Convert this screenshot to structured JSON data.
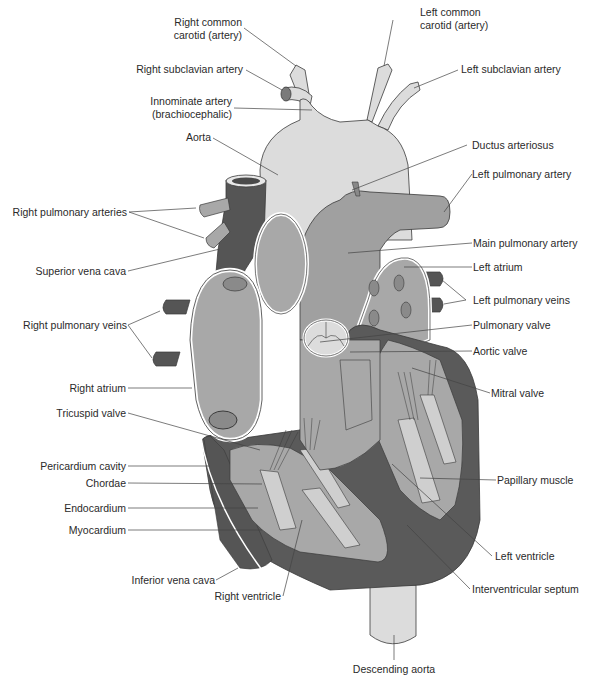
{
  "diagram": {
    "colors": {
      "aorta_light": "#dcdcdc",
      "chamber_mid": "#a8a8a8",
      "pulmonary_mid": "#9e9e9e",
      "vessel_dark": "#555555",
      "myocardium_dark": "#5a5a5a",
      "papillary_light": "#cfcfcf",
      "outline": "#3a3a3a",
      "leader_line": "#444444",
      "label_text": "#2a2a2a"
    },
    "labels": {
      "right_common_carotid": [
        "Right common",
        "carotid (artery)"
      ],
      "left_common_carotid": [
        "Left common",
        "carotid (artery)"
      ],
      "right_subclavian_artery": "Right subclavian artery",
      "left_subclavian_artery": "Left subclavian artery",
      "innominate_artery": [
        "Innominate artery",
        "(brachiocephalic)"
      ],
      "aorta": "Aorta",
      "ductus_arteriosus": "Ductus arteriosus",
      "left_pulmonary_artery": "Left pulmonary artery",
      "right_pulmonary_arteries": "Right pulmonary arteries",
      "main_pulmonary_artery": "Main pulmonary artery",
      "superior_vena_cava": "Superior vena cava",
      "left_atrium": "Left atrium",
      "left_pulmonary_veins": "Left pulmonary veins",
      "right_pulmonary_veins": "Right pulmonary veins",
      "pulmonary_valve": "Pulmonary valve",
      "aortic_valve": "Aortic valve",
      "mitral_valve": "Mitral valve",
      "right_atrium": "Right atrium",
      "tricuspid_valve": "Tricuspid valve",
      "pericardium_cavity": "Pericardium cavity",
      "chordae": "Chordae",
      "endocardium": "Endocardium",
      "myocardium": "Myocardium",
      "papillary_muscle": "Papillary muscle",
      "left_ventricle": "Left ventricle",
      "inferior_vena_cava": "Inferior vena cava",
      "right_ventricle": "Right ventricle",
      "interventricular_septum": "Interventricular septum",
      "descending_aorta": "Descending aorta"
    },
    "caption": ""
  }
}
